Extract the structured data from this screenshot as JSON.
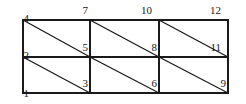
{
  "figure": {
    "type": "mesh-diagram",
    "stroke_color": "#1a1a1a",
    "background_color": "#ffffff",
    "label_color": "#1a1a1a"
  },
  "geometry": {
    "left": 23,
    "right": 228,
    "top": 20,
    "middle": 57,
    "bottom": 93,
    "col1": 90,
    "col2": 159,
    "x_columns": [
      23,
      90,
      159,
      228
    ],
    "y_rows": [
      20,
      57,
      93
    ]
  },
  "nodes": [
    {
      "id": "node-1",
      "label": "1",
      "x": 23,
      "y": 93,
      "lx": 13,
      "ly": 88,
      "align": "lbl-r"
    },
    {
      "id": "node-2",
      "label": "2",
      "x": 23,
      "y": 57,
      "lx": 13,
      "ly": 50,
      "align": "lbl-r"
    },
    {
      "id": "node-3",
      "label": "3",
      "x": 90,
      "y": 93,
      "lx": 72,
      "ly": 78,
      "align": "lbl-r"
    },
    {
      "id": "node-4",
      "label": "4",
      "x": 23,
      "y": 20,
      "lx": 13,
      "ly": 13,
      "align": "lbl-r"
    },
    {
      "id": "node-5",
      "label": "5",
      "x": 90,
      "y": 57,
      "lx": 72,
      "ly": 42,
      "align": "lbl-r"
    },
    {
      "id": "node-6",
      "label": "6",
      "x": 159,
      "y": 93,
      "lx": 141,
      "ly": 78,
      "align": "lbl-r"
    },
    {
      "id": "node-7",
      "label": "7",
      "x": 90,
      "y": 20,
      "lx": 72,
      "ly": 5,
      "align": "lbl-r"
    },
    {
      "id": "node-8",
      "label": "8",
      "x": 159,
      "y": 57,
      "lx": 141,
      "ly": 42,
      "align": "lbl-r"
    },
    {
      "id": "node-9",
      "label": "9",
      "x": 228,
      "y": 93,
      "lx": 210,
      "ly": 78,
      "align": "lbl-r"
    },
    {
      "id": "node-10",
      "label": "10",
      "x": 159,
      "y": 20,
      "lx": 136,
      "ly": 5,
      "align": "lbl-r"
    },
    {
      "id": "node-11",
      "label": "11",
      "x": 228,
      "y": 57,
      "lx": 205,
      "ly": 42,
      "align": "lbl-r"
    },
    {
      "id": "node-12",
      "label": "12",
      "x": 228,
      "y": 20,
      "lx": 205,
      "ly": 5,
      "align": "lbl-r"
    }
  ],
  "edges": {
    "horizontal": [
      {
        "name": "top-edge",
        "x1": 23,
        "y1": 20,
        "x2": 228,
        "y2": 20
      },
      {
        "name": "middle-edge",
        "x1": 23,
        "y1": 57,
        "x2": 228,
        "y2": 57
      },
      {
        "name": "bottom-edge",
        "x1": 23,
        "y1": 93,
        "x2": 228,
        "y2": 93
      }
    ],
    "vertical": [
      {
        "name": "left-edge",
        "x1": 23,
        "y1": 20,
        "x2": 23,
        "y2": 93
      },
      {
        "name": "divider-1",
        "x1": 90,
        "y1": 20,
        "x2": 90,
        "y2": 93
      },
      {
        "name": "divider-2",
        "x1": 159,
        "y1": 20,
        "x2": 159,
        "y2": 93
      },
      {
        "name": "right-edge",
        "x1": 228,
        "y1": 20,
        "x2": 228,
        "y2": 93
      }
    ],
    "diagonal": [
      {
        "name": "diagonal-cell-top-left",
        "x1": 23,
        "y1": 20,
        "x2": 90,
        "y2": 57
      },
      {
        "name": "diagonal-cell-top-middle",
        "x1": 90,
        "y1": 20,
        "x2": 159,
        "y2": 57
      },
      {
        "name": "diagonal-cell-top-right",
        "x1": 159,
        "y1": 20,
        "x2": 228,
        "y2": 57
      },
      {
        "name": "diagonal-cell-bottom-left",
        "x1": 23,
        "y1": 57,
        "x2": 90,
        "y2": 93
      },
      {
        "name": "diagonal-cell-bottom-middle",
        "x1": 90,
        "y1": 57,
        "x2": 159,
        "y2": 93
      },
      {
        "name": "diagonal-cell-bottom-right",
        "x1": 159,
        "y1": 57,
        "x2": 228,
        "y2": 93
      }
    ]
  }
}
